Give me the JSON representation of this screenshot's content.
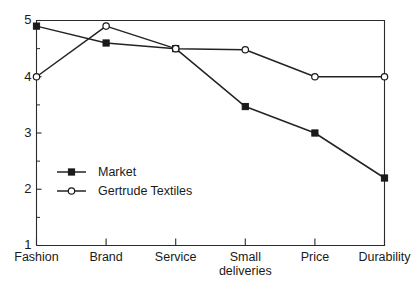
{
  "chart_data": {
    "type": "line",
    "title": "",
    "subtitle": "",
    "xlabel": "",
    "ylabel": "",
    "categories": [
      "Fashion",
      "Brand",
      "Service",
      "Small deliveries",
      "Price",
      "Durability"
    ],
    "category_lines": [
      [
        "Fashion"
      ],
      [
        "Brand"
      ],
      [
        "Service"
      ],
      [
        "Small",
        "deliveries"
      ],
      [
        "Price"
      ],
      [
        "Durability"
      ]
    ],
    "series": [
      {
        "name": "Market",
        "marker": "filled-square",
        "values": [
          4.9,
          4.6,
          4.5,
          3.47,
          3.0,
          2.2
        ]
      },
      {
        "name": "Gertrude Textiles",
        "marker": "open-circle",
        "values": [
          4.0,
          4.9,
          4.5,
          4.48,
          4.0,
          4.0
        ]
      }
    ],
    "ylim": [
      1,
      5
    ],
    "yticks": [
      1,
      2,
      3,
      4,
      5
    ],
    "ytick_labels": [
      "1",
      "2",
      "3",
      "4",
      "5"
    ],
    "yminor_ticks": [
      1.5,
      2.5,
      3.5,
      4.5
    ],
    "grid": false,
    "legend_position": "inside-lower-left",
    "colors": {
      "line": "#232323",
      "axis": "#2b2b2b",
      "text": "#1a1a1a",
      "background": "#ffffff",
      "marker_fill_open": "#ffffff"
    }
  },
  "legend": {
    "entries": [
      {
        "label": "Market"
      },
      {
        "label": "Gertrude Textiles"
      }
    ]
  }
}
